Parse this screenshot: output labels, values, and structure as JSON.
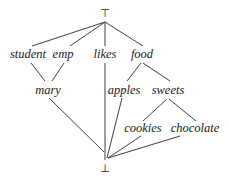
{
  "diagram": {
    "type": "lattice",
    "top": {
      "label": "⊤"
    },
    "bottom": {
      "label": "⊥"
    },
    "nodes": [
      {
        "id": "student",
        "label": "student"
      },
      {
        "id": "emp",
        "label": "emp"
      },
      {
        "id": "likes",
        "label": "likes"
      },
      {
        "id": "food",
        "label": "food"
      },
      {
        "id": "mary",
        "label": "mary"
      },
      {
        "id": "apples",
        "label": "apples"
      },
      {
        "id": "sweets",
        "label": "sweets"
      },
      {
        "id": "cookies",
        "label": "cookies"
      },
      {
        "id": "chocolate",
        "label": "chocolate"
      }
    ],
    "edges": [
      [
        "top",
        "student"
      ],
      [
        "top",
        "emp"
      ],
      [
        "top",
        "likes"
      ],
      [
        "top",
        "food"
      ],
      [
        "student",
        "mary"
      ],
      [
        "emp",
        "mary"
      ],
      [
        "food",
        "apples"
      ],
      [
        "food",
        "sweets"
      ],
      [
        "sweets",
        "cookies"
      ],
      [
        "sweets",
        "chocolate"
      ],
      [
        "mary",
        "bottom"
      ],
      [
        "likes",
        "bottom"
      ],
      [
        "apples",
        "bottom"
      ],
      [
        "cookies",
        "bottom"
      ],
      [
        "chocolate",
        "bottom"
      ]
    ]
  }
}
